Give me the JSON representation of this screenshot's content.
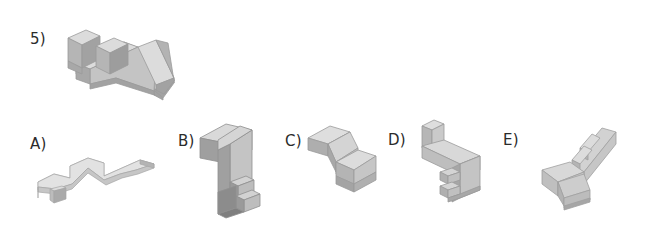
{
  "item": {
    "number_label": "5)",
    "type": "mental-rotation-item",
    "option_count": 5
  },
  "target": {
    "label": "5)",
    "description": "reference 3-D block figure"
  },
  "options": [
    {
      "key": "A",
      "label": "A)"
    },
    {
      "key": "B",
      "label": "B)"
    },
    {
      "key": "C",
      "label": "C)"
    },
    {
      "key": "D",
      "label": "D)"
    },
    {
      "key": "E",
      "label": "E)"
    }
  ],
  "colors": {
    "background": "#ffffff",
    "face_top": "#dcdcdc",
    "face_front": "#bdbdbd",
    "face_side": "#a2a2a2",
    "face_dark": "#8e8e8e",
    "edge": "#9a9a9a",
    "text": "#2b2b2b"
  }
}
